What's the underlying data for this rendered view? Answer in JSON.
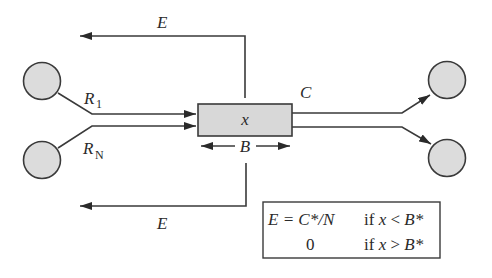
{
  "diagram": {
    "type": "buffer-flow",
    "colors": {
      "stroke": "#3a3a3a",
      "node_fill": "#dcdcdc",
      "buffer_fill": "#d8d8d8",
      "background": "#ffffff"
    },
    "labels": {
      "feedback_top": "E",
      "feedback_bottom": "E",
      "input_1_main": "R",
      "input_1_sub": "1",
      "input_n_main": "R",
      "input_n_sub": "N",
      "buffer": "x",
      "capacity": "C",
      "buffer_size": "B"
    },
    "nodes": [
      {
        "id": "source-1",
        "role": "input",
        "label": "R1"
      },
      {
        "id": "source-n",
        "role": "input",
        "label": "RN"
      },
      {
        "id": "sink-1",
        "role": "output"
      },
      {
        "id": "sink-2",
        "role": "output"
      }
    ],
    "edges": [
      {
        "from": "source-1",
        "to": "buffer",
        "label": "R1"
      },
      {
        "from": "source-n",
        "to": "buffer",
        "label": "RN"
      },
      {
        "from": "buffer",
        "to": "sink-1",
        "label": "C"
      },
      {
        "from": "buffer",
        "to": "sink-2"
      },
      {
        "from": "buffer",
        "to": "feedback-top",
        "label": "E"
      },
      {
        "from": "buffer",
        "to": "feedback-bottom",
        "label": "E"
      }
    ],
    "formula": {
      "row1": {
        "lhs": "E = C*/N",
        "cond_prefix": "if ",
        "cond_var": "x",
        "cond_op": " < ",
        "cond_rhs": "B*"
      },
      "row2": {
        "lhs": "0",
        "cond_prefix": "if ",
        "cond_var": "x",
        "cond_op": " > ",
        "cond_rhs": "B*"
      }
    }
  }
}
